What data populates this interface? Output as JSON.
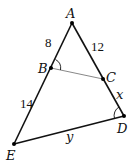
{
  "diagram": {
    "type": "geometry-triangle",
    "points": {
      "A": {
        "label": "A",
        "x": 72,
        "y": 23
      },
      "B": {
        "label": "B",
        "x": 51,
        "y": 68
      },
      "C": {
        "label": "C",
        "x": 103,
        "y": 79
      },
      "D": {
        "label": "D",
        "x": 124,
        "y": 116
      },
      "E": {
        "label": "E",
        "x": 14,
        "y": 144
      }
    },
    "segment_labels": {
      "AB": "8",
      "AC": "12",
      "BE": "14",
      "CD": "x",
      "ED": "y"
    },
    "angle_marks": [
      "ABC",
      "ADE"
    ]
  }
}
